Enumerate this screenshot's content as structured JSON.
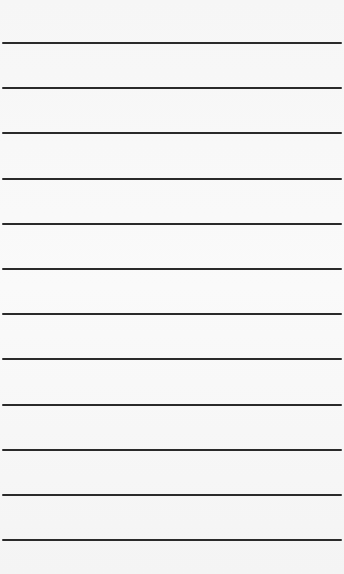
{
  "paper": {
    "background": "#f8f8f8",
    "rule_color": "#2a2a2a",
    "rules": [
      {
        "y": 42
      },
      {
        "y": 87
      },
      {
        "y": 132
      },
      {
        "y": 178
      },
      {
        "y": 223
      },
      {
        "y": 268
      },
      {
        "y": 313
      },
      {
        "y": 358
      },
      {
        "y": 404
      },
      {
        "y": 449
      },
      {
        "y": 494
      },
      {
        "y": 539
      }
    ]
  }
}
